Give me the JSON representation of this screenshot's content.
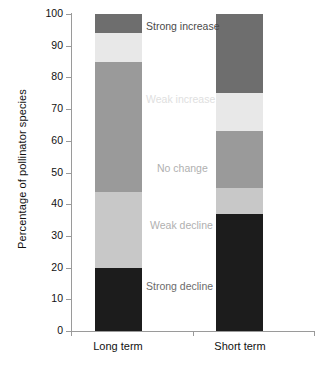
{
  "chart_data": {
    "type": "bar",
    "subtype": "stacked-bar-100-percent",
    "title": "",
    "xlabel": "",
    "ylabel": "Percentage of pollinator species",
    "ylim": [
      0,
      100
    ],
    "ytick_values": [
      0,
      10,
      20,
      30,
      40,
      50,
      60,
      70,
      80,
      90,
      100
    ],
    "ytick_labels": [
      "0",
      "10",
      "20",
      "30",
      "40",
      "50",
      "60",
      "70",
      "80",
      "90",
      "100"
    ],
    "categories": [
      "Long term",
      "Short term"
    ],
    "grid": false,
    "legend_position": "in-plot-annotations",
    "series": [
      {
        "name": "Strong decline",
        "values": [
          20,
          37
        ],
        "color": "#1c1c1c",
        "label_color": "#6b6b6b"
      },
      {
        "name": "Weak decline",
        "values": [
          24,
          8
        ],
        "color": "#c8c8c8",
        "label_color": "#b0b0b0"
      },
      {
        "name": "No change",
        "values": [
          41,
          18
        ],
        "color": "#9a9a9a",
        "label_color": "#b0b0b0"
      },
      {
        "name": "Weak increase",
        "values": [
          9,
          12
        ],
        "color": "#e8e8e8",
        "label_color": "#e0e0e0"
      },
      {
        "name": "Strong increase",
        "values": [
          6,
          25
        ],
        "color": "#6e6e6e",
        "label_color": "#4a4a4a"
      }
    ],
    "annotations": [
      {
        "text": "Strong increase",
        "value_y": 96,
        "note": "dark grey top segment"
      },
      {
        "text": "Weak increase",
        "value_y": 73,
        "note": "very light grey segment"
      },
      {
        "text": "No change",
        "value_y": 51,
        "note": "medium grey segment"
      },
      {
        "text": "Weak decline",
        "value_y": 33,
        "note": "light grey segment"
      },
      {
        "text": "Strong decline",
        "value_y": 14,
        "note": "black segment"
      }
    ]
  },
  "axis": {
    "y_title": "Percentage of pollinator species"
  }
}
